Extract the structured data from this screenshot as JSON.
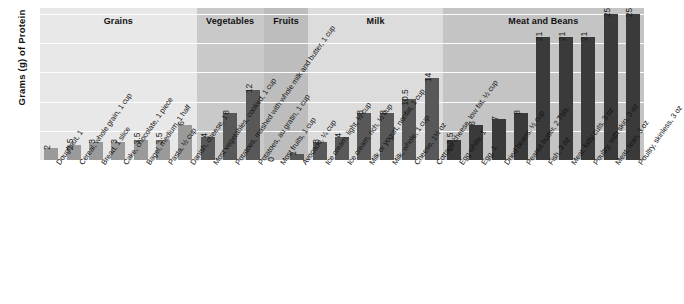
{
  "chart_data": {
    "type": "bar",
    "title": "",
    "xlabel": "",
    "ylabel": "Grams (g) of Protein",
    "ylim": [
      0,
      26
    ],
    "grid": true,
    "gridlines": [
      5,
      10,
      15,
      20,
      25
    ],
    "legend_position": "none",
    "group_bands": [
      {
        "label": "Grains",
        "count": 7,
        "band_color": "#e8e8e8",
        "bar_color": "#9a9a9a"
      },
      {
        "label": "Vegetables",
        "count": 3,
        "band_color": "#c9c9c9",
        "bar_color": "#585858"
      },
      {
        "label": "Fruits",
        "count": 2,
        "band_color": "#bdbdbd",
        "bar_color": "#585858"
      },
      {
        "label": "Milk",
        "count": 6,
        "band_color": "#dcdcdc",
        "bar_color": "#585858"
      },
      {
        "label": "Meat and Beans",
        "count": 9,
        "band_color": "#c4c4c4",
        "bar_color": "#3a3a3a"
      }
    ],
    "categories": [
      "Doughnut, 1",
      "Cereal, whole grain, 1 cup",
      "Bread, 1 slice",
      "Cake, chocolate, 1 piece",
      "Bagel, medium, 1 half",
      "Pasta, ½ cup",
      "Danish, cheese, 1",
      "Most vegetables, cooked, 1 cup",
      "Potatoes, mashed with whole milk and butter, 1 cup",
      "Potatoes, au gratin, 1 cup",
      "Most fruits, 1 cup",
      "Avocado, ¼ cup",
      "Ice cream, light, ½ cup",
      "Ice cream, rich, ½ cup",
      "Milk or yogurt, nonfat, 1 cup",
      "Milk, whole, 1 cup",
      "Cheese, 1½ oz",
      "Cottage cheese, low fat, ½ cup",
      "Egg white, 1",
      "Egg, 1",
      "Dried beans, ½ cup",
      "Peanut butter, 2 Tbls.",
      "Fish, 3 oz",
      "Meat, fatty cuts, 3 oz",
      "Poultry, with skin, 3 oz",
      "Meat, lean, 3 oz",
      "Poultry, skinless, 3 oz"
    ],
    "values": [
      2,
      2.5,
      3,
      3,
      3.5,
      3.5,
      6,
      4,
      8,
      12,
      0,
      1,
      3,
      4,
      8,
      8,
      10.5,
      14,
      3.5,
      6,
      7,
      8,
      21,
      21,
      21,
      25,
      25
    ],
    "value_labels": [
      "2",
      "2.5",
      "3",
      "3",
      "3.5",
      "3.5",
      "6",
      "4",
      "8",
      "12",
      "0",
      "1",
      "3",
      "4",
      "8",
      "8",
      "10.5",
      "14",
      "3.5",
      "6",
      "7",
      "8",
      "21",
      "21",
      "21",
      "25",
      "25"
    ]
  },
  "colors": {
    "background": "#ffffff",
    "plot_base": "#e8e8e8",
    "gridline": "#ffffff",
    "text": "#111111"
  }
}
